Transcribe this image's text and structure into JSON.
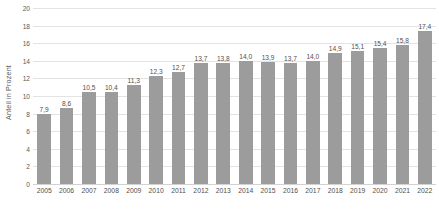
{
  "chart_data": {
    "type": "bar",
    "title": "",
    "subtitle": "",
    "xlabel": "",
    "ylabel": "Anteil in Prozent",
    "ylim": [
      0,
      20
    ],
    "ytick_step": 2,
    "ytick_labels": [
      "0",
      "2",
      "4",
      "6",
      "8",
      "10",
      "12",
      "14",
      "16",
      "18",
      "20"
    ],
    "grid": true,
    "legend": false,
    "legend_position": "none",
    "bar_color": "#9c9c9c",
    "gridline_color": "#e3e3e3",
    "label_decimal_separator": ",",
    "categories": [
      "2005",
      "2006",
      "2007",
      "2008",
      "2009",
      "2010",
      "2011",
      "2012",
      "2013",
      "2014",
      "2015",
      "2016",
      "2017",
      "2018",
      "2019",
      "2020",
      "2021",
      "2022"
    ],
    "values": [
      7.9,
      8.6,
      10.5,
      10.4,
      11.3,
      12.3,
      12.7,
      13.7,
      13.8,
      14.0,
      13.9,
      13.7,
      14.0,
      14.9,
      15.1,
      15.4,
      15.8,
      17.4
    ],
    "data_labels": [
      "7,9",
      "8,6",
      "10,5",
      "10,4",
      "11,3",
      "12,3",
      "12,7",
      "13,7",
      "13,8",
      "14,0",
      "13,9",
      "13,7",
      "14,0",
      "14,9",
      "15,1",
      "15,4",
      "15,8",
      "17,4"
    ]
  }
}
